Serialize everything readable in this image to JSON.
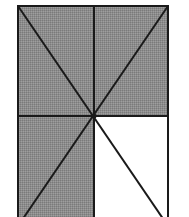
{
  "diagram": {
    "shade_color": "#8c8c8c",
    "line_color": "#1a1a1a",
    "background_color": "#ffffff",
    "rectangle": {
      "left": 18,
      "top": 6,
      "right": 168,
      "bottom": 226
    },
    "center": {
      "x": 94,
      "y": 116
    },
    "shaded_regions": [
      "top-left quadrant",
      "top-right quadrant",
      "bottom-left quadrant"
    ],
    "unshaded_regions": [
      "bottom-right quadrant"
    ]
  }
}
